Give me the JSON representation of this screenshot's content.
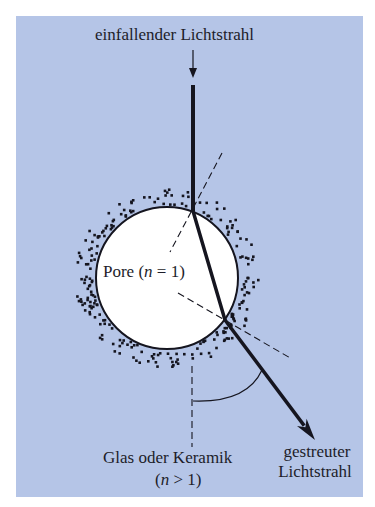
{
  "labels": {
    "incident_ray": "einfallender Lichtstrahl",
    "pore_prefix": "Pore (",
    "pore_var": "n",
    "pore_suffix": " = 1)",
    "material_line1": "Glas oder Keramik",
    "material_line2_prefix": "(",
    "material_line2_var": "n",
    "material_line2_suffix": " > 1)",
    "scattered_line1": "gestreuter",
    "scattered_line2": "Lichtstrahl"
  },
  "colors": {
    "background": "#b5c5e7",
    "pore_fill": "#ffffff",
    "ink": "#15151f"
  },
  "geometry": {
    "pore_center": [
      167,
      278
    ],
    "pore_radius": 71,
    "incident_small_arrow": {
      "x": 193,
      "y1": 50,
      "y2": 78
    },
    "incident_ray": {
      "x": 193,
      "y1": 85,
      "y2": 211
    },
    "entry_point": [
      193,
      211
    ],
    "exit_point": [
      225,
      320
    ],
    "scattered_arrow_tip": [
      315,
      440
    ],
    "normal_entry_dashed": [
      [
        222,
        153
      ],
      [
        170,
        252
      ]
    ],
    "normal_exit_dashed": [
      [
        178,
        293
      ],
      [
        292,
        359
      ]
    ],
    "vertical_dashed": {
      "x": 192,
      "y1": 366,
      "y2": 447
    },
    "angle_arc": {
      "from": [
        193,
        401
      ],
      "to": [
        262,
        370
      ]
    }
  }
}
